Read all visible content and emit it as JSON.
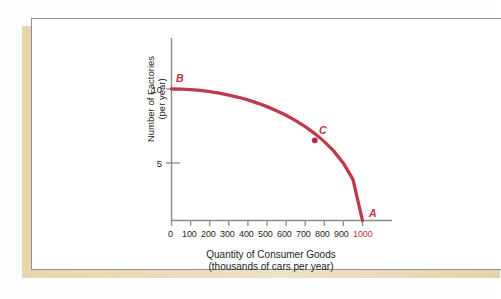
{
  "figure": {
    "background_color": "#ffffff",
    "card_color": "#ffffff",
    "shadow_color": "#e6d6ae",
    "border_color": "#8f9094"
  },
  "chart_data": {
    "type": "line",
    "title": "",
    "subtitle": "",
    "xlabel": "Quantity of Consumer Goods",
    "xlabel_line2": "(thousands of cars per year)",
    "ylabel": "Number of Factories",
    "ylabel_line2": "(per year)",
    "xlim": [
      0,
      1050
    ],
    "ylim": [
      0,
      11.6
    ],
    "grid": false,
    "legend": "none",
    "curve_color": "#be3a4f",
    "x_ticks": [
      0,
      100,
      200,
      300,
      400,
      500,
      600,
      700,
      800,
      900,
      1000
    ],
    "x_tick_labels": [
      "0",
      "100",
      "200",
      "300",
      "400",
      "500",
      "600",
      "700",
      "800",
      "900",
      "1000"
    ],
    "x_tick_label_colors": [
      "#231f20",
      "#231f20",
      "#231f20",
      "#231f20",
      "#231f20",
      "#231f20",
      "#231f20",
      "#231f20",
      "#231f20",
      "#231f20",
      "#c0334a"
    ],
    "y_ticks": [
      5,
      10
    ],
    "y_tick_labels": [
      "5",
      "10"
    ],
    "series": [
      {
        "name": "Production Possibilities Frontier",
        "x": [
          0,
          50,
          100,
          150,
          200,
          250,
          300,
          350,
          400,
          450,
          500,
          550,
          600,
          650,
          700,
          750,
          800,
          850,
          900,
          950,
          1000
        ],
        "y": [
          10.0,
          9.99,
          9.95,
          9.89,
          9.8,
          9.68,
          9.54,
          9.37,
          9.17,
          8.93,
          8.66,
          8.35,
          8.0,
          7.6,
          7.14,
          6.61,
          6.0,
          5.27,
          4.36,
          3.12,
          0.0
        ]
      }
    ],
    "annotations": [
      {
        "label": "A",
        "x": 1000,
        "y": 0,
        "marker": false,
        "color": "#c0334a"
      },
      {
        "label": "B",
        "x": 0,
        "y": 10,
        "marker": false,
        "color": "#c0334a"
      },
      {
        "label": "C",
        "x": 750,
        "y": 6.1,
        "marker": true,
        "color": "#c0334a"
      }
    ]
  }
}
